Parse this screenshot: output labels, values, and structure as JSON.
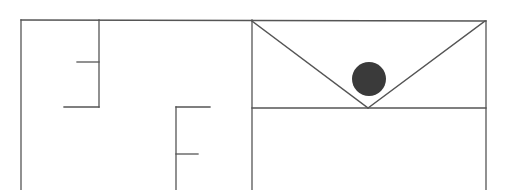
{
  "diagram": {
    "type": "floor-plan",
    "stroke_color": "#555555",
    "fill_color": "#3a3a3a",
    "background": "#ffffff",
    "walls": [
      {
        "id": "outer-left",
        "x1": 21,
        "y1": 20,
        "x2": 21,
        "y2": 190
      },
      {
        "id": "outer-top",
        "x1": 21,
        "y1": 20,
        "x2": 486,
        "y2": 21
      },
      {
        "id": "wall-a-vertical",
        "x1": 99,
        "y1": 20,
        "x2": 99,
        "y2": 107
      },
      {
        "id": "wall-a-stub-upper",
        "x1": 77,
        "y1": 62,
        "x2": 99,
        "y2": 62
      },
      {
        "id": "wall-a-stub-lower",
        "x1": 64,
        "y1": 107,
        "x2": 99,
        "y2": 107
      },
      {
        "id": "wall-b-vertical",
        "x1": 176,
        "y1": 107,
        "x2": 176,
        "y2": 190
      },
      {
        "id": "wall-b-stub-upper",
        "x1": 176,
        "y1": 107,
        "x2": 210,
        "y2": 107
      },
      {
        "id": "wall-b-stub-lower",
        "x1": 176,
        "y1": 154,
        "x2": 198,
        "y2": 154
      },
      {
        "id": "room-left-wall",
        "x1": 252,
        "y1": 20,
        "x2": 252,
        "y2": 190
      },
      {
        "id": "room-right-wall",
        "x1": 486,
        "y1": 21,
        "x2": 486,
        "y2": 190
      },
      {
        "id": "room-divider",
        "x1": 252,
        "y1": 108,
        "x2": 486,
        "y2": 108
      },
      {
        "id": "diagonal-left",
        "x1": 252,
        "y1": 21,
        "x2": 368,
        "y2": 108
      },
      {
        "id": "diagonal-right",
        "x1": 368,
        "y1": 108,
        "x2": 485,
        "y2": 21
      }
    ],
    "markers": [
      {
        "id": "agent-position",
        "cx": 369,
        "cy": 79,
        "r": 17
      }
    ]
  }
}
